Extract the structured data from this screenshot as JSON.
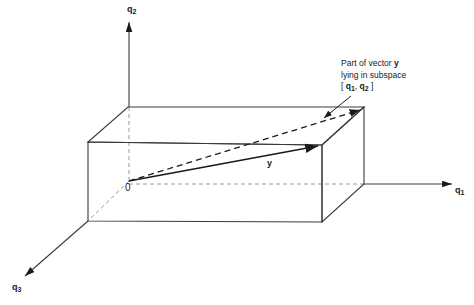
{
  "figure": {
    "background_color": "#ffffff",
    "line_color": "#3a3a3a",
    "dashed_color": "#9a9a9a",
    "vector_color": "#1a1a1a",
    "text_color": "#1a1a1a"
  },
  "axes": [
    {
      "name": "q1",
      "label": "q",
      "subscript": "1",
      "direction": "right"
    },
    {
      "name": "q2",
      "label": "q",
      "subscript": "2",
      "direction": "up"
    },
    {
      "name": "q3",
      "label": "q",
      "subscript": "3",
      "direction": "down-left"
    }
  ],
  "origin": {
    "label": "0"
  },
  "vectors": [
    {
      "name": "y",
      "label": "y",
      "style": "solid",
      "description": "vector y drawn from origin to front-top-right corner of box"
    },
    {
      "name": "y-projection",
      "label": "",
      "style": "dashed",
      "description": "part of vector y lying in subspace [q1, q2]"
    }
  ],
  "annotation": {
    "line1_prefix": "Part of vector ",
    "line1_bold": "y",
    "line2": "lying in subspace",
    "line3_open": "[ ",
    "line3_q1": "q",
    "line3_q1_sub": "1",
    "line3_comma": ", ",
    "line3_q2": "q",
    "line3_q2_sub": "2",
    "line3_close": " ]"
  },
  "shape": {
    "name": "rectangular-box",
    "faces": [
      "top",
      "front",
      "right",
      "hidden-back",
      "hidden-left",
      "hidden-bottom"
    ]
  }
}
